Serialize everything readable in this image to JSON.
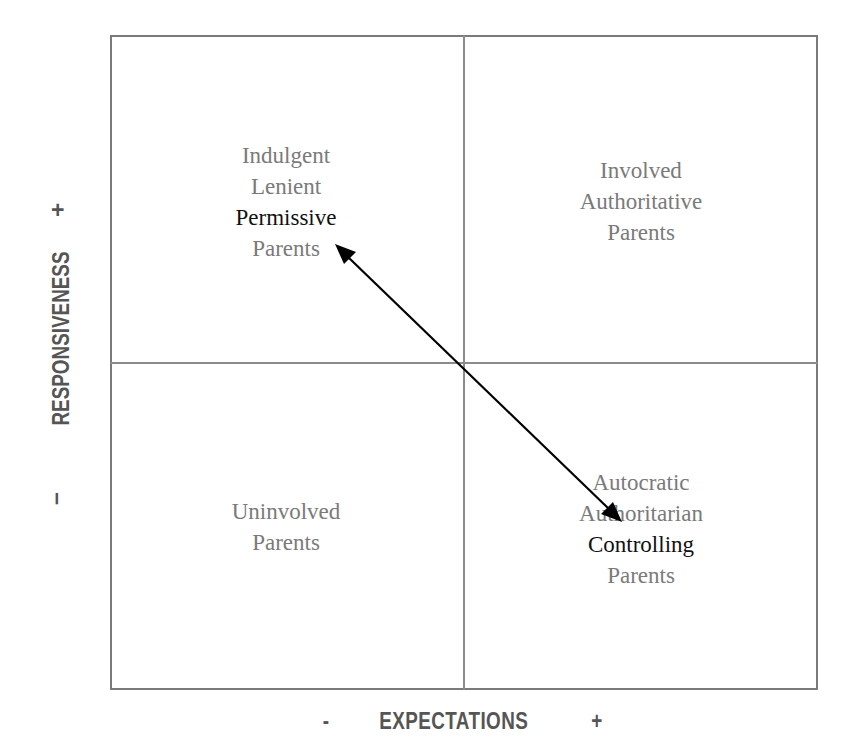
{
  "diagram": {
    "x_axis": {
      "label": "EXPECTATIONS",
      "minus": "-",
      "plus": "+"
    },
    "y_axis": {
      "label": "RESPONSIVENESS",
      "minus": "–",
      "plus": "+"
    },
    "quadrants": {
      "top_left": {
        "lines": [
          "Indulgent",
          "Lenient",
          "Permissive",
          "Parents"
        ],
        "emphasis": "Permissive"
      },
      "top_right": {
        "lines": [
          "Involved",
          "Authoritative",
          "Parents"
        ]
      },
      "bottom_left": {
        "lines": [
          "Uninvolved",
          "Parents"
        ]
      },
      "bottom_right": {
        "lines": [
          "Autocratic",
          "Authoritarian",
          "Controlling",
          "Parents"
        ],
        "emphasis": "Controlling"
      }
    },
    "arrow": {
      "type": "double-headed",
      "from": "top_left (Permissive)",
      "to": "bottom_right (Controlling)"
    },
    "colors": {
      "grid": "#8a8a8a",
      "quadrant_text": "#7a7a7a",
      "emphasis_text": "#111111",
      "axis_text": "#555555",
      "arrow": "#000000"
    }
  }
}
